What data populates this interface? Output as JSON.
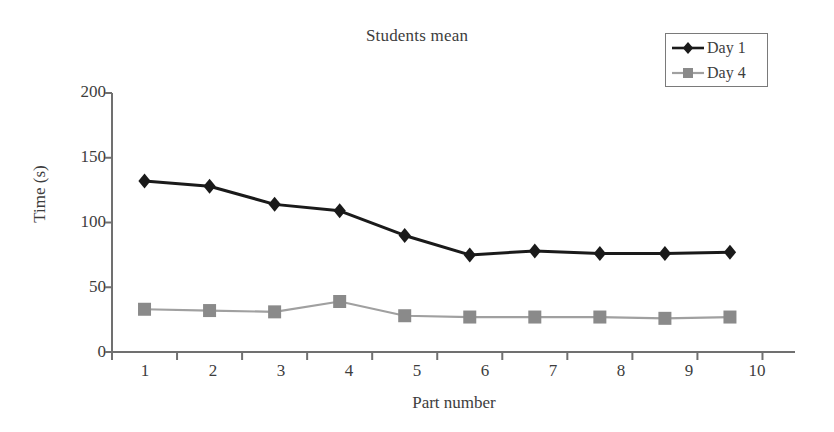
{
  "chart_data": {
    "type": "line",
    "title": "Students mean",
    "xlabel": "Part number",
    "ylabel": "Time (s)",
    "categories": [
      "1",
      "2",
      "3",
      "4",
      "5",
      "6",
      "7",
      "8",
      "9",
      "10"
    ],
    "x": [
      1,
      2,
      3,
      4,
      5,
      6,
      7,
      8,
      9,
      10
    ],
    "series": [
      {
        "name": "Day 1",
        "marker": "diamond",
        "color": "#1a1a1a",
        "values": [
          132,
          128,
          114,
          109,
          90,
          75,
          78,
          76,
          76,
          77
        ]
      },
      {
        "name": "Day 4",
        "marker": "square",
        "color": "#8a8a8a",
        "values": [
          33,
          32,
          31,
          39,
          28,
          27,
          27,
          27,
          26,
          27
        ]
      }
    ],
    "ylim": [
      0,
      200
    ],
    "yticks": [
      0,
      50,
      100,
      150,
      200
    ],
    "ytick_labels": [
      "0",
      "50",
      "100",
      "150",
      "200"
    ],
    "xlim": [
      0.5,
      10.5
    ],
    "grid": false,
    "legend_position": "top-right",
    "axis_color": "#707070"
  },
  "legend": {
    "entries": [
      {
        "label": "Day 1"
      },
      {
        "label": "Day 4"
      }
    ]
  }
}
